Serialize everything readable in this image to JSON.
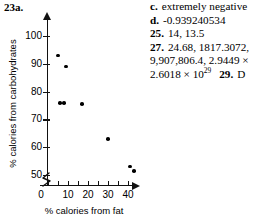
{
  "figure": {
    "label": "23a."
  },
  "chart_data": {
    "type": "scatter",
    "title": "23a.",
    "xlabel": "% calories from fat",
    "ylabel": "% calories from carbohydrates",
    "xlim": [
      0,
      47
    ],
    "ylim": [
      47,
      104
    ],
    "xticks": [
      "0",
      "10",
      "20",
      "30",
      "40"
    ],
    "xtick_values": [
      0,
      10,
      20,
      30,
      40
    ],
    "yticks": [
      "50",
      "60",
      "70",
      "80",
      "90",
      "100"
    ],
    "ytick_values": [
      50,
      60,
      70,
      80,
      90,
      100
    ],
    "x_axis_break": true,
    "y_axis_break": true,
    "grid": false,
    "legend": null,
    "marker": "filled-circle",
    "marker_color": "#000000",
    "points": [
      {
        "x": 5,
        "y": 93
      },
      {
        "x": 9,
        "y": 89
      },
      {
        "x": 6,
        "y": 76
      },
      {
        "x": 8,
        "y": 76
      },
      {
        "x": 17,
        "y": 75.5
      },
      {
        "x": 30,
        "y": 63
      },
      {
        "x": 41,
        "y": 53
      },
      {
        "x": 43,
        "y": 51.5
      }
    ]
  },
  "answers": {
    "lines": [
      {
        "key": "c.",
        "key_bold": true,
        "text": "extremely negative"
      },
      {
        "key": "d.",
        "key_bold": true,
        "text": "-0.939240534"
      },
      {
        "key": "25.",
        "key_bold": true,
        "text": "14, 13.5"
      },
      {
        "key": "27.",
        "key_bold": true,
        "text": "24.68, 1817.3072,"
      },
      {
        "key": "",
        "key_bold": false,
        "text": "9,907,806.4, 2.9449 ×"
      }
    ],
    "last_line": {
      "mantissa": "2.6018 × 10",
      "exponent": "29",
      "next_key": "29.",
      "next_text": "D"
    }
  }
}
